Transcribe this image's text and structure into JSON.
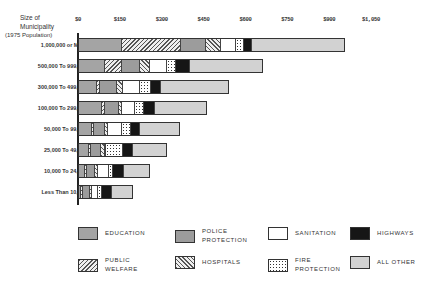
{
  "chart_data": {
    "type": "bar",
    "orientation": "horizontal",
    "stacked": true,
    "title": "",
    "ylabel": "Size of Municipality (1975 Population)",
    "xlabel": "",
    "x_ticks": [
      "$0",
      "$150",
      "$300",
      "$450",
      "$600",
      "$750",
      "$900",
      "$1,050"
    ],
    "xlim": [
      0,
      1050
    ],
    "categories": [
      "1,000,000 or More",
      "500,000 To 999,999",
      "300,000 To 499,999",
      "100,000 To 299,999",
      "50,000 To 99,999",
      "25,000 To 49,999",
      "10,000 To 24,999",
      "Less Than 10,000"
    ],
    "series": [
      {
        "name": "EDUCATION",
        "key": "education",
        "values": [
          154,
          93,
          65,
          82,
          47,
          36,
          22,
          7
        ]
      },
      {
        "name": "PUBLIC WELFARE",
        "key": "welfare",
        "values": [
          211,
          61,
          11,
          11,
          7,
          7,
          7,
          7
        ]
      },
      {
        "name": "POLICE PROTECTION",
        "key": "police",
        "values": [
          90,
          65,
          61,
          50,
          39,
          36,
          29,
          25
        ]
      },
      {
        "name": "HOSPITALS",
        "key": "hospitals",
        "values": [
          54,
          36,
          22,
          11,
          11,
          14,
          11,
          7
        ]
      },
      {
        "name": "SANITATION",
        "key": "sanitation",
        "values": [
          54,
          61,
          61,
          47,
          50,
          4,
          39,
          22
        ]
      },
      {
        "name": "FIRE PROTECTION",
        "key": "fire",
        "values": [
          29,
          32,
          39,
          32,
          32,
          61,
          14,
          14
        ]
      },
      {
        "name": "HIGHWAYS",
        "key": "highways",
        "values": [
          29,
          50,
          36,
          39,
          32,
          36,
          39,
          36
        ]
      },
      {
        "name": "ALL OTHER",
        "key": "other",
        "values": [
          330,
          258,
          240,
          183,
          140,
          118,
          90,
          72
        ]
      }
    ],
    "legend_position": "bottom",
    "grid": false
  },
  "axis": {
    "head_line1": "Size of",
    "head_line2": "Municipality",
    "head_line3": "(1975 Population)"
  },
  "legend": [
    {
      "key": "education",
      "label": "EDUCATION"
    },
    {
      "key": "police",
      "label": "POLICE PROTECTION"
    },
    {
      "key": "sanitation",
      "label": "SANITATION"
    },
    {
      "key": "highways",
      "label": "HIGHWAYS"
    },
    {
      "key": "welfare",
      "label": "PUBLIC WELFARE"
    },
    {
      "key": "hospitals",
      "label": "HOSPITALS"
    },
    {
      "key": "fire",
      "label": "FIRE PROTECTION"
    },
    {
      "key": "other",
      "label": "ALL OTHER"
    }
  ]
}
